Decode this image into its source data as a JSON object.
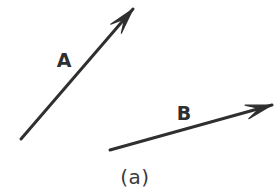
{
  "figure": {
    "caption": "(a)",
    "background_color": "#ffffff",
    "stroke_color": "#2f2f2f",
    "label_color": "#2f2f2f",
    "width": 280,
    "height": 194,
    "vectors": [
      {
        "id": "vector-a",
        "label": "A",
        "label_x": 64,
        "label_y": 67,
        "tail_x": 21,
        "tail_y": 139,
        "tip_x": 133,
        "tip_y": 9,
        "stroke_width": 3,
        "arrowhead": "barbed"
      },
      {
        "id": "vector-b",
        "label": "B",
        "label_x": 184,
        "label_y": 120,
        "tail_x": 110,
        "tail_y": 150,
        "tip_x": 272,
        "tip_y": 105,
        "stroke_width": 3,
        "arrowhead": "barbed"
      }
    ],
    "caption_x": 135,
    "caption_y": 184
  }
}
